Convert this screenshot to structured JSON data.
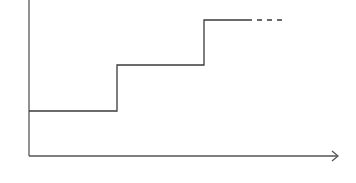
{
  "diagram": {
    "type": "step-function",
    "colors": {
      "background": "#ffffff",
      "line": "#3a3a3a",
      "axis": "#555555"
    },
    "axes": {
      "origin": [
        29,
        156
      ],
      "y_axis_top": 0,
      "x_axis_end": 338,
      "x_arrow": true,
      "y_arrow": false
    },
    "steps": [
      {
        "level_y": 111,
        "x_start": 29,
        "x_end": 117
      },
      {
        "level_y": 65,
        "x_start": 117,
        "x_end": 204
      },
      {
        "level_y": 20,
        "x_start": 204,
        "x_end": 247
      }
    ],
    "continuation": {
      "style": "dashed",
      "y": 20,
      "x_start": 247,
      "x_end": 285
    }
  }
}
